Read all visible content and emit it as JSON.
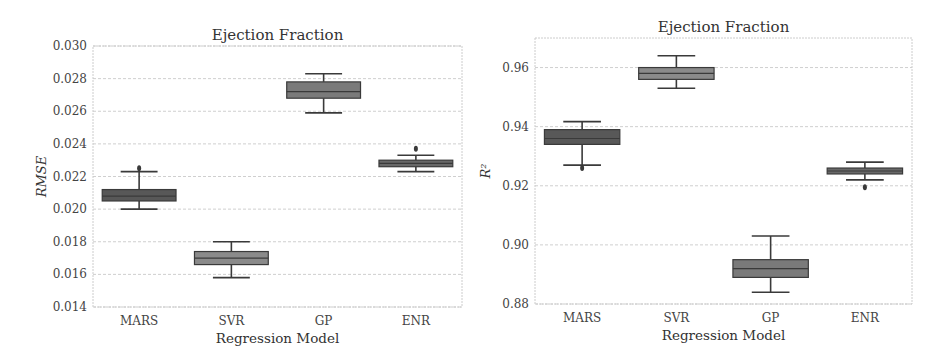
{
  "chart_data": [
    {
      "type": "box",
      "title": "Ejection Fraction",
      "xlabel": "Regression Model",
      "ylabel": "RMSE",
      "categories": [
        "MARS",
        "SVR",
        "GP",
        "ENR"
      ],
      "ylim": [
        0.014,
        0.03
      ],
      "yticks": [
        0.014,
        0.016,
        0.018,
        0.02,
        0.022,
        0.024,
        0.026,
        0.028,
        0.03
      ],
      "ytick_labels": [
        "0.014",
        "0.016",
        "0.018",
        "0.020",
        "0.022",
        "0.024",
        "0.026",
        "0.028",
        "0.030"
      ],
      "grid": true,
      "series": [
        {
          "name": "MARS",
          "whisker_low": 0.02,
          "q1": 0.0205,
          "median": 0.0208,
          "q3": 0.0212,
          "whisker_high": 0.0223,
          "outliers": [
            0.0225
          ],
          "color": "#585858"
        },
        {
          "name": "SVR",
          "whisker_low": 0.0158,
          "q1": 0.0166,
          "median": 0.017,
          "q3": 0.0174,
          "whisker_high": 0.018,
          "outliers": [],
          "color": "#8a8a8a"
        },
        {
          "name": "GP",
          "whisker_low": 0.0259,
          "q1": 0.0268,
          "median": 0.0272,
          "q3": 0.0278,
          "whisker_high": 0.0283,
          "outliers": [],
          "color": "#7a7a7a"
        },
        {
          "name": "ENR",
          "whisker_low": 0.0223,
          "q1": 0.0226,
          "median": 0.0228,
          "q3": 0.023,
          "whisker_high": 0.0233,
          "outliers": [
            0.0237
          ],
          "color": "#686868"
        }
      ]
    },
    {
      "type": "box",
      "title": "Ejection Fraction",
      "xlabel": "Regression Model",
      "ylabel": "R²",
      "categories": [
        "MARS",
        "SVR",
        "GP",
        "ENR"
      ],
      "ylim": [
        0.88,
        0.97
      ],
      "yticks": [
        0.88,
        0.9,
        0.92,
        0.94,
        0.96
      ],
      "ytick_labels": [
        "0.88",
        "0.90",
        "0.92",
        "0.94",
        "0.96"
      ],
      "grid": true,
      "series": [
        {
          "name": "MARS",
          "whisker_low": 0.927,
          "q1": 0.934,
          "median": 0.936,
          "q3": 0.939,
          "whisker_high": 0.9417,
          "outliers": [
            0.926
          ],
          "color": "#585858"
        },
        {
          "name": "SVR",
          "whisker_low": 0.953,
          "q1": 0.956,
          "median": 0.958,
          "q3": 0.96,
          "whisker_high": 0.964,
          "outliers": [],
          "color": "#8a8a8a"
        },
        {
          "name": "GP",
          "whisker_low": 0.884,
          "q1": 0.889,
          "median": 0.892,
          "q3": 0.895,
          "whisker_high": 0.903,
          "outliers": [],
          "color": "#7a7a7a"
        },
        {
          "name": "ENR",
          "whisker_low": 0.922,
          "q1": 0.924,
          "median": 0.925,
          "q3": 0.926,
          "whisker_high": 0.928,
          "outliers": [
            0.9195
          ],
          "color": "#686868"
        }
      ]
    }
  ],
  "layout": {
    "panels": [
      {
        "left": 93,
        "right": 462,
        "top": 46,
        "bottom": 307,
        "title_y": 40,
        "xtick_y": 325,
        "xlabel_y": 343,
        "ylabel_x": 46
      },
      {
        "left": 535,
        "right": 912,
        "top": 38,
        "bottom": 304,
        "title_y": 32,
        "xtick_y": 322,
        "xlabel_y": 340,
        "ylabel_x": 490
      }
    ]
  }
}
